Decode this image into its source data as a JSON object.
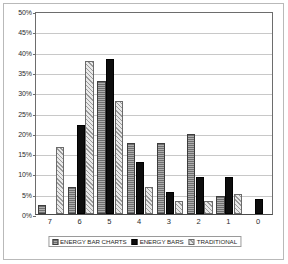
{
  "chart_data": {
    "type": "bar",
    "title": "",
    "subtitle": "",
    "xlabel": "",
    "ylabel": "",
    "categories": [
      "7",
      "6",
      "5",
      "4",
      "3",
      "2",
      "1",
      "0"
    ],
    "ylim": [
      0,
      50
    ],
    "ytick_labels": [
      "0%",
      "5%",
      "10%",
      "15%",
      "20%",
      "25%",
      "30%",
      "35%",
      "40%",
      "45%",
      "50%"
    ],
    "ytick_values": [
      0,
      5,
      10,
      15,
      20,
      25,
      30,
      35,
      40,
      45,
      50
    ],
    "grid": true,
    "legend_position": "bottom",
    "series": [
      {
        "name": "ENERGY BAR CHARTS",
        "color": "#8c8c8c",
        "values": [
          2.2,
          6.6,
          32.7,
          17.4,
          17.4,
          19.7,
          4.5,
          0
        ]
      },
      {
        "name": "ENERGY BARS",
        "color": "#0d0d0d",
        "values": [
          0,
          21.9,
          38.2,
          12.8,
          5.4,
          9.2,
          9.2,
          3.7
        ]
      },
      {
        "name": "TRADITIONAL",
        "color": "#dddddd",
        "values": [
          16.5,
          37.8,
          27.9,
          6.6,
          3.3,
          3.3,
          5.0,
          0
        ]
      }
    ]
  },
  "legend": {
    "items": [
      {
        "label": "ENERGY BAR CHARTS"
      },
      {
        "label": "ENERGY BARS"
      },
      {
        "label": "TRADITIONAL"
      }
    ]
  }
}
